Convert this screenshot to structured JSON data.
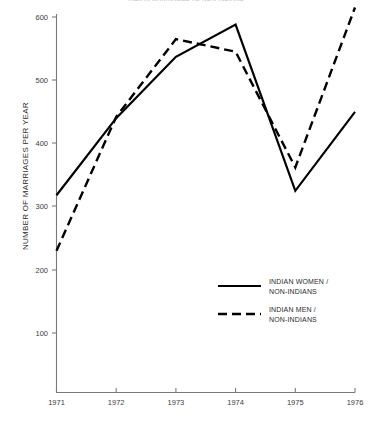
{
  "chart_data": {
    "type": "line",
    "title": "INDIAN MARRIAGES TO NON-INDIANS",
    "xlabel": "",
    "ylabel": "NUMBER OF MARRIAGES PER YEAR",
    "x": [
      "1971",
      "1972",
      "1973",
      "1974",
      "1975",
      "1976"
    ],
    "xlim": [
      1971,
      1976
    ],
    "ylim": [
      0,
      620
    ],
    "yticks": [
      "100",
      "200",
      "300",
      "400",
      "500",
      "600"
    ],
    "ytick_values": [
      100,
      200,
      300,
      400,
      500,
      600
    ],
    "grid": false,
    "legend_position": "center-right",
    "series": [
      {
        "name": "INDIAN WOMEN / NON-INDIANS",
        "style": "solid",
        "color": "#000000",
        "values": [
          318,
          440,
          537,
          588,
          325,
          450
        ]
      },
      {
        "name": "INDIAN MEN / NON-INDIANS",
        "style": "dashed",
        "color": "#000000",
        "values": [
          230,
          442,
          565,
          545,
          362,
          615
        ]
      }
    ],
    "legend": [
      {
        "line1": "INDIAN WOMEN /",
        "line2": "NON-INDIANS",
        "style": "solid"
      },
      {
        "line1": "INDIAN MEN /",
        "line2": "NON-INDIANS",
        "style": "dashed"
      }
    ]
  }
}
